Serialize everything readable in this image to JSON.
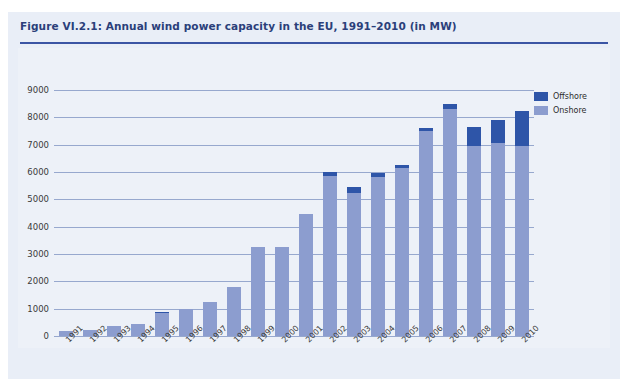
{
  "figure": {
    "title": "Figure VI.2.1: Annual wind power capacity in the EU, 1991–2010 (in MW)",
    "source": "Source: EWEA (2008a)",
    "accent_color": "#3b55a4",
    "panel_color": "#edf1f8",
    "band_color": "#e9eef7"
  },
  "legend": {
    "position": "top-right",
    "entries": [
      {
        "label": "Offshore",
        "color": "#2e55a8"
      },
      {
        "label": "Onshore",
        "color": "#8c9dcf"
      }
    ]
  },
  "chart_data": {
    "type": "bar",
    "stacked": true,
    "title": "Figure VI.2.1: Annual wind power capacity in the EU, 1991–2010 (in MW)",
    "xlabel": "",
    "ylabel": "",
    "ylim": [
      0,
      9000
    ],
    "ytick_step": 1000,
    "yticks": [
      "0",
      "1000",
      "2000",
      "3000",
      "4000",
      "5000",
      "6000",
      "7000",
      "8000",
      "9000"
    ],
    "grid": true,
    "categories": [
      "1991",
      "1992",
      "1993",
      "1994",
      "1995",
      "1996",
      "1997",
      "1998",
      "1999",
      "2000",
      "2001",
      "2002",
      "2003",
      "2004",
      "2005",
      "2006",
      "2007",
      "2008",
      "2009",
      "2010"
    ],
    "series": [
      {
        "name": "Onshore",
        "color": "#8c9dcf",
        "values": [
          175,
          215,
          350,
          430,
          830,
          1000,
          1250,
          1800,
          3250,
          3250,
          4450,
          5870,
          5250,
          5830,
          6150,
          7500,
          8300,
          6950,
          7050,
          6950
        ]
      },
      {
        "name": "Offshore",
        "color": "#2e55a8",
        "values": [
          25,
          0,
          0,
          0,
          50,
          0,
          0,
          0,
          0,
          0,
          0,
          130,
          200,
          120,
          90,
          100,
          200,
          700,
          850,
          1300
        ]
      }
    ],
    "totals": [
      200,
      215,
      350,
      430,
      880,
      1000,
      1250,
      1800,
      3250,
      3250,
      4450,
      6000,
      5450,
      5950,
      6240,
      7600,
      8500,
      7650,
      7900,
      8250
    ]
  }
}
